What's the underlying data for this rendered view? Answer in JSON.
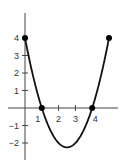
{
  "chart_data": {
    "type": "line",
    "title": "",
    "xlabel": "",
    "ylabel": "",
    "function": "y = x^2 - 5x + 4",
    "x": [
      0,
      0.25,
      0.5,
      0.75,
      1,
      1.25,
      1.5,
      1.75,
      2,
      2.25,
      2.5,
      2.75,
      3,
      3.25,
      3.5,
      3.75,
      4,
      4.25,
      4.5,
      4.75,
      5
    ],
    "series": [
      {
        "name": "curve",
        "values": [
          4,
          2.8125,
          1.75,
          0.8125,
          0,
          -0.6875,
          -1.25,
          -1.6875,
          -2,
          -2.1875,
          -2.25,
          -2.1875,
          -2,
          -1.6875,
          -1.25,
          -0.6875,
          0,
          0.8125,
          1.75,
          2.8125,
          4
        ]
      }
    ],
    "marked_points": [
      {
        "x": 0,
        "y": 4
      },
      {
        "x": 1,
        "y": 0
      },
      {
        "x": 4,
        "y": 0
      },
      {
        "x": 5,
        "y": 4
      }
    ],
    "x_ticks": [
      {
        "value": 1,
        "label": "1"
      },
      {
        "value": 2,
        "label": "2"
      },
      {
        "value": 3,
        "label": "3"
      },
      {
        "value": 4,
        "label": "4"
      }
    ],
    "y_ticks": [
      {
        "value": 4,
        "label": "4"
      },
      {
        "value": 3,
        "label": "3"
      },
      {
        "value": 2,
        "label": "2"
      },
      {
        "value": 1,
        "label": "1"
      },
      {
        "value": -1,
        "label": "−1"
      },
      {
        "value": -2,
        "label": "−2"
      }
    ],
    "xlim": [
      -1,
      5.6
    ],
    "ylim": [
      -3,
      5.4
    ],
    "grid": false,
    "legend": null,
    "colors": {
      "curve": "#111111",
      "axes": "#444444",
      "points": "#000000"
    }
  }
}
